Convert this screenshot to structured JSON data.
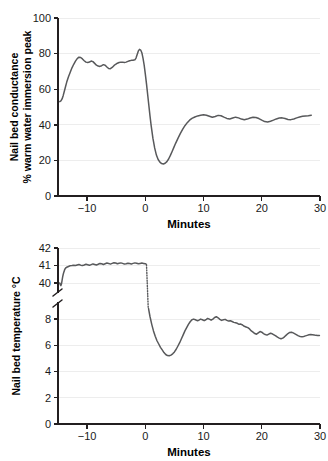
{
  "figure": {
    "background_color": "#ffffff",
    "line_color": "#58595b",
    "axis_color": "#231f20",
    "grid_color": "#ededed"
  },
  "chart_data": [
    {
      "id": "nail-bed-conductance",
      "type": "line",
      "title": "",
      "xlabel": "Minutes",
      "ylabel": "Nail bed conductance\n% warm water immersion peak",
      "ylabel_line1": "Nail bed conductance",
      "ylabel_line2": "% warm water immersion peak",
      "xlim": [
        -15,
        30
      ],
      "ylim": [
        0,
        100
      ],
      "xticks": [
        -10,
        0,
        10,
        20,
        30
      ],
      "xticklabels": [
        "−10",
        "0",
        "10",
        "20",
        "30"
      ],
      "yticks": [
        0,
        20,
        40,
        60,
        80,
        100
      ],
      "yticklabels": [
        "0",
        "20",
        "40",
        "60",
        "80",
        "100"
      ],
      "grid": true,
      "grid_axis": "y",
      "legend": "none",
      "series": [
        {
          "name": "Nail bed conductance",
          "x": [
            -14.7,
            -14.5,
            -14.3,
            -14.1,
            -13.9,
            -13.7,
            -13.5,
            -13.2,
            -12.9,
            -12.6,
            -12.3,
            -12.0,
            -11.7,
            -11.4,
            -11.1,
            -10.8,
            -10.5,
            -10.2,
            -9.9,
            -9.6,
            -9.3,
            -9.0,
            -8.7,
            -8.4,
            -8.1,
            -7.8,
            -7.5,
            -7.2,
            -6.9,
            -6.6,
            -6.3,
            -6.0,
            -5.7,
            -5.4,
            -5.1,
            -4.8,
            -4.5,
            -4.2,
            -3.9,
            -3.6,
            -3.3,
            -3.0,
            -2.7,
            -2.4,
            -2.1,
            -1.8,
            -1.6,
            -1.4,
            -1.2,
            -1.0,
            -0.8,
            -0.6,
            -0.4,
            -0.2,
            0.0,
            0.2,
            0.4,
            0.6,
            0.8,
            1.0,
            1.3,
            1.6,
            1.9,
            2.2,
            2.5,
            2.8,
            3.1,
            3.4,
            3.7,
            4.0,
            4.3,
            4.6,
            4.9,
            5.2,
            5.6,
            6.0,
            6.4,
            6.8,
            7.2,
            7.6,
            8.0,
            8.5,
            9.0,
            9.5,
            10.0,
            10.5,
            11.0,
            11.5,
            12.0,
            12.5,
            13.0,
            13.5,
            14.0,
            14.5,
            15.0,
            15.5,
            16.0,
            16.5,
            17.0,
            17.5,
            18.0,
            18.5,
            19.0,
            19.5,
            20.0,
            20.5,
            21.0,
            21.5,
            22.0,
            22.5,
            23.0,
            23.5,
            24.0,
            24.5,
            25.0,
            25.5,
            26.0,
            26.5,
            27.0,
            27.5,
            28.0,
            28.5
          ],
          "y": [
            53.0,
            53.4,
            54.5,
            56.5,
            59.0,
            61.5,
            64.0,
            67.0,
            69.5,
            72.0,
            74.0,
            75.8,
            77.2,
            78.0,
            77.8,
            77.0,
            76.0,
            75.2,
            75.0,
            75.3,
            75.8,
            75.5,
            74.5,
            73.5,
            73.0,
            72.8,
            73.2,
            73.8,
            73.5,
            72.5,
            71.6,
            71.5,
            72.2,
            73.2,
            74.0,
            74.6,
            75.0,
            75.2,
            75.2,
            75.0,
            75.2,
            75.6,
            76.0,
            76.2,
            76.3,
            76.5,
            77.5,
            79.5,
            81.5,
            82.4,
            82.0,
            80.5,
            77.5,
            73.5,
            68.5,
            63.0,
            57.0,
            51.0,
            45.0,
            39.5,
            32.5,
            27.0,
            23.0,
            20.5,
            19.0,
            18.2,
            18.0,
            18.4,
            19.3,
            20.8,
            22.8,
            25.0,
            27.3,
            29.6,
            32.4,
            35.0,
            37.4,
            39.5,
            41.2,
            42.6,
            43.6,
            44.4,
            45.0,
            45.4,
            45.6,
            45.4,
            44.8,
            44.2,
            44.7,
            45.3,
            45.1,
            44.3,
            43.6,
            43.3,
            43.8,
            44.3,
            43.9,
            43.2,
            42.8,
            43.2,
            43.8,
            44.2,
            44.1,
            43.5,
            42.6,
            41.8,
            41.6,
            42.0,
            42.6,
            43.3,
            43.8,
            43.9,
            43.5,
            43.0,
            42.9,
            43.3,
            43.9,
            44.4,
            44.8,
            45.0,
            45.1,
            45.4,
            46.0,
            46.8,
            46.6
          ]
        }
      ]
    },
    {
      "id": "nail-bed-temperature",
      "type": "line",
      "title": "",
      "xlabel": "Minutes",
      "ylabel": "Nail bed temperature °C",
      "xlim": [
        -15,
        30
      ],
      "xticks": [
        -10,
        0,
        10,
        20,
        30
      ],
      "xticklabels": [
        "−10",
        "0",
        "10",
        "20",
        "30"
      ],
      "yticks_lower": [
        0,
        2,
        4,
        6,
        8
      ],
      "yticks_upper": [
        40,
        41,
        42
      ],
      "yticklabels_lower": [
        "0",
        "2",
        "4",
        "6",
        "8"
      ],
      "yticklabels_upper": [
        "40",
        "41",
        "42"
      ],
      "broken_axis": true,
      "ylim_lower": [
        0,
        9
      ],
      "ylim_upper": [
        39.6,
        42
      ],
      "grid": true,
      "grid_axis": "y",
      "legend": "none",
      "series": [
        {
          "name": "Nail bed temperature (warm phase)",
          "segment": "upper",
          "x": [
            -14.7,
            -14.6,
            -14.5,
            -14.4,
            -14.3,
            -14.2,
            -14.1,
            -14.0,
            -13.9,
            -13.8,
            -13.7,
            -13.6,
            -13.5,
            -13.3,
            -13.1,
            -12.9,
            -12.6,
            -12.3,
            -12.0,
            -11.7,
            -11.4,
            -11.1,
            -10.8,
            -10.5,
            -10.2,
            -9.9,
            -9.6,
            -9.3,
            -9.0,
            -8.7,
            -8.4,
            -8.1,
            -7.8,
            -7.5,
            -7.2,
            -6.9,
            -6.6,
            -6.3,
            -6.0,
            -5.7,
            -5.4,
            -5.1,
            -4.8,
            -4.5,
            -4.2,
            -3.9,
            -3.6,
            -3.3,
            -3.0,
            -2.7,
            -2.4,
            -2.1,
            -1.8,
            -1.5,
            -1.2,
            -0.9,
            -0.6,
            -0.3,
            0.0,
            0.15
          ],
          "y": [
            40.0,
            39.9,
            39.85,
            39.95,
            40.15,
            40.35,
            40.5,
            40.62,
            40.72,
            40.8,
            40.85,
            40.88,
            40.9,
            40.93,
            40.96,
            40.99,
            41.0,
            41.02,
            41.0,
            41.03,
            41.06,
            41.02,
            41.0,
            41.03,
            41.07,
            41.04,
            41.01,
            41.05,
            41.09,
            41.06,
            41.03,
            41.07,
            41.12,
            41.1,
            41.06,
            41.1,
            41.14,
            41.12,
            41.08,
            41.12,
            41.16,
            41.14,
            41.1,
            41.13,
            41.15,
            41.12,
            41.08,
            41.1,
            41.13,
            41.11,
            41.09,
            41.12,
            41.15,
            41.13,
            41.1,
            41.12,
            41.14,
            41.12,
            41.1,
            41.08
          ]
        },
        {
          "name": "Transition (axis break)",
          "segment": "break",
          "style": "dotted",
          "x": [
            0.2,
            0.35,
            0.5
          ],
          "y_upper": 41.05,
          "y_lower": 8.85
        },
        {
          "name": "Nail bed temperature (cold phase)",
          "segment": "lower",
          "x": [
            0.55,
            0.8,
            1.1,
            1.4,
            1.7,
            2.0,
            2.3,
            2.6,
            2.9,
            3.2,
            3.5,
            3.8,
            4.1,
            4.4,
            4.7,
            5.0,
            5.3,
            5.6,
            5.9,
            6.2,
            6.5,
            6.8,
            7.1,
            7.4,
            7.7,
            8.0,
            8.3,
            8.6,
            8.9,
            9.2,
            9.5,
            9.8,
            10.1,
            10.4,
            10.7,
            11.0,
            11.3,
            11.6,
            11.9,
            12.2,
            12.5,
            12.8,
            13.1,
            13.4,
            13.7,
            14.0,
            14.3,
            14.6,
            14.9,
            15.2,
            15.5,
            15.8,
            16.1,
            16.4,
            16.7,
            17.0,
            17.3,
            17.6,
            17.9,
            18.2,
            18.5,
            18.8,
            19.1,
            19.4,
            19.7,
            20.0,
            20.3,
            20.6,
            20.9,
            21.2,
            21.5,
            21.8,
            22.1,
            22.4,
            22.7,
            23.0,
            23.3,
            23.6,
            23.9,
            24.2,
            24.5,
            24.8,
            25.1,
            25.4,
            25.7,
            26.0,
            26.3,
            26.6,
            26.9,
            27.2,
            27.5,
            27.8,
            28.1,
            28.4,
            28.7,
            29.0,
            29.3,
            29.6,
            29.9
          ],
          "y": [
            8.8,
            8.2,
            7.6,
            7.1,
            6.7,
            6.35,
            6.1,
            5.85,
            5.65,
            5.45,
            5.3,
            5.22,
            5.2,
            5.25,
            5.35,
            5.5,
            5.7,
            5.95,
            6.2,
            6.5,
            6.8,
            7.1,
            7.35,
            7.6,
            7.8,
            7.95,
            8.0,
            7.95,
            7.88,
            7.92,
            8.0,
            7.95,
            7.88,
            7.95,
            8.05,
            8.0,
            7.92,
            8.0,
            8.12,
            8.18,
            8.1,
            7.98,
            7.9,
            7.95,
            7.98,
            7.9,
            7.85,
            7.88,
            7.82,
            7.75,
            7.72,
            7.68,
            7.6,
            7.62,
            7.55,
            7.45,
            7.4,
            7.35,
            7.25,
            7.1,
            7.0,
            6.9,
            6.85,
            6.95,
            7.05,
            7.0,
            6.9,
            6.82,
            6.78,
            6.85,
            6.92,
            6.88,
            6.8,
            6.72,
            6.62,
            6.55,
            6.5,
            6.55,
            6.65,
            6.78,
            6.9,
            6.98,
            7.0,
            6.95,
            6.88,
            6.8,
            6.72,
            6.68,
            6.65,
            6.68,
            6.72,
            6.76,
            6.8,
            6.82,
            6.8,
            6.78,
            6.76,
            6.75,
            6.75
          ]
        }
      ]
    }
  ]
}
